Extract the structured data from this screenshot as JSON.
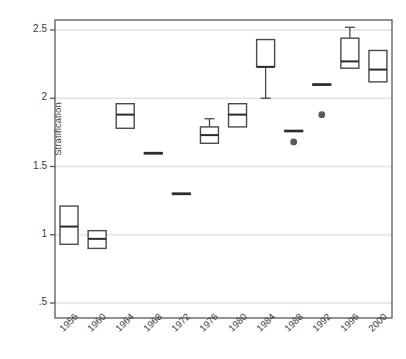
{
  "chart_data": {
    "type": "box",
    "title": "",
    "xlabel": "",
    "ylabel": "Stratification",
    "categories": [
      "1956",
      "1960",
      "1964",
      "1968",
      "1972",
      "1976",
      "1980",
      "1984",
      "1988",
      "1992",
      "1996",
      "2000"
    ],
    "ylim": [
      0.38,
      2.62
    ],
    "yticks": [
      0.5,
      1.0,
      1.5,
      2.0,
      2.5
    ],
    "ytick_labels": [
      ".5",
      "1",
      "1.5",
      "2",
      "2.5"
    ],
    "grid": "horizontal",
    "legend": "none",
    "boxes": [
      {
        "category": "1956",
        "whisker_low": null,
        "q1": 0.93,
        "median": 1.06,
        "q3": 1.21,
        "whisker_high": null,
        "outliers": []
      },
      {
        "category": "1960",
        "whisker_low": null,
        "q1": 0.9,
        "median": 0.97,
        "q3": 1.03,
        "whisker_high": null,
        "outliers": []
      },
      {
        "category": "1964",
        "whisker_low": null,
        "q1": 1.78,
        "median": 1.88,
        "q3": 1.96,
        "whisker_high": null,
        "outliers": []
      },
      {
        "category": "1968",
        "whisker_low": null,
        "q1": 1.6,
        "median": 1.6,
        "q3": 1.6,
        "whisker_high": null,
        "outliers": []
      },
      {
        "category": "1972",
        "whisker_low": null,
        "q1": 1.295,
        "median": 1.3,
        "q3": 1.305,
        "whisker_high": null,
        "outliers": []
      },
      {
        "category": "1976",
        "whisker_low": null,
        "q1": 1.67,
        "median": 1.73,
        "q3": 1.79,
        "whisker_high": 1.85,
        "outliers": []
      },
      {
        "category": "1980",
        "whisker_low": null,
        "q1": 1.79,
        "median": 1.88,
        "q3": 1.96,
        "whisker_high": null,
        "outliers": []
      },
      {
        "category": "1984",
        "whisker_low": 2.0,
        "q1": 2.23,
        "median": 2.23,
        "q3": 2.43,
        "whisker_high": null,
        "outliers": []
      },
      {
        "category": "1988",
        "whisker_low": null,
        "q1": 1.755,
        "median": 1.76,
        "q3": 1.765,
        "whisker_high": null,
        "outliers": [
          1.68
        ]
      },
      {
        "category": "1992",
        "whisker_low": null,
        "q1": 2.095,
        "median": 2.1,
        "q3": 2.105,
        "whisker_high": null,
        "outliers": [
          1.88
        ]
      },
      {
        "category": "1996",
        "whisker_low": null,
        "q1": 2.22,
        "median": 2.27,
        "q3": 2.44,
        "whisker_high": 2.52,
        "outliers": []
      },
      {
        "category": "2000",
        "whisker_low": null,
        "q1": 2.12,
        "median": 2.21,
        "q3": 2.35,
        "whisker_high": null,
        "outliers": []
      }
    ],
    "colors": {
      "box_stroke": "#4a4a4a",
      "box_fill": "#ffffff",
      "median": "#2b2b2b",
      "whisker": "#4a4a4a",
      "outlier": "#5a5a5a",
      "grid": "#e8e8e8",
      "axis": "#595959",
      "text": "#3a3a3a"
    }
  },
  "axes": {
    "y_title": "Stratification",
    "y_tick_labels": [
      ".5",
      "1",
      "1.5",
      "2",
      "2.5"
    ],
    "x_tick_labels": [
      "1956",
      "1960",
      "1964",
      "1968",
      "1972",
      "1976",
      "1980",
      "1984",
      "1988",
      "1992",
      "1996",
      "2000"
    ]
  }
}
